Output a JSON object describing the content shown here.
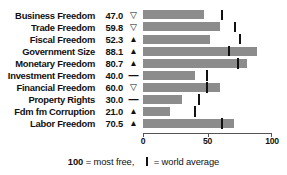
{
  "chart_data": {
    "type": "bar",
    "title": "",
    "xlabel": "",
    "ylabel": "",
    "xlim": [
      0,
      100
    ],
    "grid": false,
    "legend_position": "bottom",
    "axis_ticks": [
      {
        "value": 0,
        "label": "0"
      },
      {
        "value": 50,
        "label": "50"
      },
      {
        "value": 100,
        "label": "100"
      }
    ],
    "categories": [
      "Business Freedom",
      "Trade Freedom",
      "Fiscal Freedom",
      "Government Size",
      "Monetary Freedom",
      "Investment Freedom",
      "Financial Freedom",
      "Property Rights",
      "Fdm fm Corruption",
      "Labor Freedom"
    ],
    "values": [
      47.0,
      59.8,
      52.3,
      88.1,
      80.7,
      40.0,
      60.0,
      30.0,
      21.0,
      70.5
    ],
    "value_labels": [
      "47.0",
      "59.8",
      "52.3",
      "88.1",
      "80.7",
      "40.0",
      "60.0",
      "30.0",
      "21.0",
      "70.5"
    ],
    "trend_symbols": [
      "▽",
      "▽",
      "▲",
      "▲",
      "▲",
      "—",
      "▽",
      "—",
      "▲",
      "▲"
    ],
    "trend_names": [
      "down-open",
      "down-open",
      "up-filled",
      "up-filled",
      "up-filled",
      "flat",
      "down-open",
      "flat",
      "up-filled",
      "up-filled"
    ],
    "world_average": [
      61.0,
      71.0,
      75.0,
      66.5,
      74.0,
      49.5,
      49.5,
      43.5,
      40.5,
      61.5
    ],
    "series": [
      {
        "name": "Country score",
        "values": [
          47.0,
          59.8,
          52.3,
          88.1,
          80.7,
          40.0,
          60.0,
          30.0,
          21.0,
          70.5
        ]
      },
      {
        "name": "World average",
        "values": [
          61.0,
          71.0,
          75.0,
          66.5,
          74.0,
          49.5,
          49.5,
          43.5,
          40.5,
          61.5
        ]
      }
    ],
    "colors": {
      "bar": "#8c8c8c",
      "marker": "#111111",
      "axis": "#555555",
      "text": "#111111"
    }
  },
  "footer": {
    "scale_note_value": "100",
    "scale_note_text": " = most free,",
    "legend_text": " = world average"
  }
}
